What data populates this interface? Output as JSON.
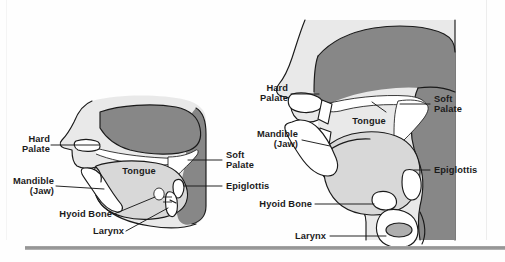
{
  "figure": {
    "title": "",
    "type": "anatomical-diagram",
    "background_color": "#ffffff",
    "ink_color": "#1a1a1a",
    "tones": {
      "dark_gray": "#878787",
      "mid_gray": "#9d9d9d",
      "light_gray": "#d8d8d8",
      "pale_gray": "#e9e9e9",
      "white": "#ffffff",
      "rule_gray": "#8e8e8e"
    }
  },
  "diagrams": [
    {
      "id": "left-diagram",
      "name": "lateral-head-view",
      "labels": [
        {
          "id": "hard-palate",
          "text": "Hard\nPalate",
          "align": "right"
        },
        {
          "id": "mandible",
          "text": "Mandible\n(Jaw)",
          "align": "right"
        },
        {
          "id": "hyoid-bone",
          "text": "Hyoid Bone",
          "align": "right"
        },
        {
          "id": "larynx",
          "text": "Larynx",
          "align": "right"
        },
        {
          "id": "tongue",
          "text": "Tongue",
          "align": "center"
        },
        {
          "id": "soft-palate",
          "text": "Soft\nPalate",
          "align": "left"
        },
        {
          "id": "epiglottis",
          "text": "Epiglottis",
          "align": "left"
        }
      ]
    },
    {
      "id": "right-diagram",
      "name": "sagittal-vocal-tract-view",
      "labels": [
        {
          "id": "hard-palate",
          "text": "Hard\nPalate",
          "align": "right"
        },
        {
          "id": "mandible",
          "text": "Mandible\n(Jaw)",
          "align": "right"
        },
        {
          "id": "hyoid-bone",
          "text": "Hyoid Bone",
          "align": "right"
        },
        {
          "id": "larynx",
          "text": "Larynx",
          "align": "right"
        },
        {
          "id": "tongue",
          "text": "Tongue",
          "align": "center"
        },
        {
          "id": "soft-palate",
          "text": "Soft\nPalate",
          "align": "left"
        },
        {
          "id": "epiglottis",
          "text": "Epiglottis",
          "align": "left"
        }
      ]
    }
  ],
  "labels_flat": {
    "l_hard_palate": "Hard\nPalate",
    "l_mandible": "Mandible\n(Jaw)",
    "l_hyoid": "Hyoid Bone",
    "l_larynx": "Larynx",
    "l_tongue": "Tongue",
    "l_soft_palate": "Soft\nPalate",
    "l_epiglottis": "Epiglottis",
    "r_hard_palate": "Hard\nPalate",
    "r_mandible": "Mandible\n(Jaw)",
    "r_hyoid": "Hyoid Bone",
    "r_larynx": "Larynx",
    "r_tongue": "Tongue",
    "r_soft_palate": "Soft\nPalate",
    "r_epiglottis": "Epiglottis"
  }
}
